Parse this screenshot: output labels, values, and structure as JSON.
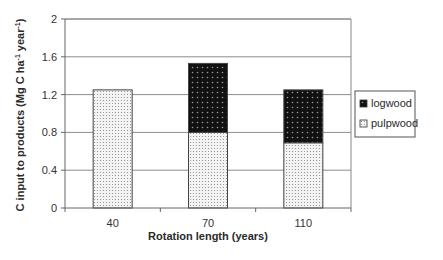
{
  "chart_data": {
    "type": "bar",
    "stacked": true,
    "title": "",
    "xlabel": "Rotation length (years)",
    "ylabel": "C input to products (Mg C ha",
    "ylabel_sup1": "-1",
    "ylabel_mid": " year",
    "ylabel_sup2": "-1",
    "ylabel_end": ")",
    "categories": [
      "40",
      "70",
      "110"
    ],
    "series": [
      {
        "name": "pulpwood",
        "values": [
          1.25,
          0.8,
          0.69
        ],
        "fill": "dotted-light"
      },
      {
        "name": "logwood",
        "values": [
          0.0,
          0.73,
          0.56
        ],
        "fill": "dotted-dark"
      }
    ],
    "ylim": [
      0,
      2
    ],
    "yticks": [
      "0",
      "0.4",
      "0.8",
      "1.2",
      "1.6",
      "2"
    ],
    "ytick_values": [
      0,
      0.4,
      0.8,
      1.2,
      1.6,
      2
    ],
    "grid": true,
    "legend_position": "right",
    "legend": [
      "logwood",
      "pulpwood"
    ]
  }
}
